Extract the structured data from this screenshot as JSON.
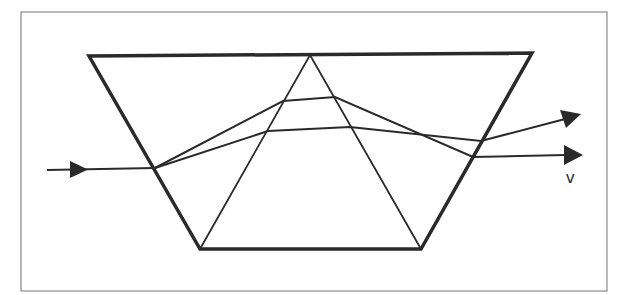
{
  "diagram": {
    "colors": {
      "line": "#2a2a2a",
      "frame": "#8a8a8a",
      "background": "#ffffff"
    },
    "frame": {
      "x": 21,
      "y": 12,
      "w": 586,
      "h": 279
    },
    "outer_trapezoid": [
      [
        89,
        56
      ],
      [
        532,
        53
      ],
      [
        421,
        249
      ],
      [
        200,
        249
      ]
    ],
    "inner_triangle": [
      [
        310,
        55
      ],
      [
        200,
        249
      ],
      [
        421,
        249
      ]
    ],
    "incoming_ray": {
      "from": [
        47,
        170
      ],
      "to": [
        155,
        168
      ]
    },
    "rays": [
      {
        "name": "upper-ray",
        "points": [
          [
            155,
            168
          ],
          [
            283,
            101
          ],
          [
            335,
            97
          ],
          [
            473,
            157
          ],
          [
            583,
            155
          ]
        ]
      },
      {
        "name": "lower-ray",
        "points": [
          [
            155,
            168
          ],
          [
            268,
            131
          ],
          [
            350,
            127
          ],
          [
            481,
            141
          ],
          [
            581,
            115
          ]
        ]
      }
    ],
    "labels": {
      "v": "v"
    }
  }
}
